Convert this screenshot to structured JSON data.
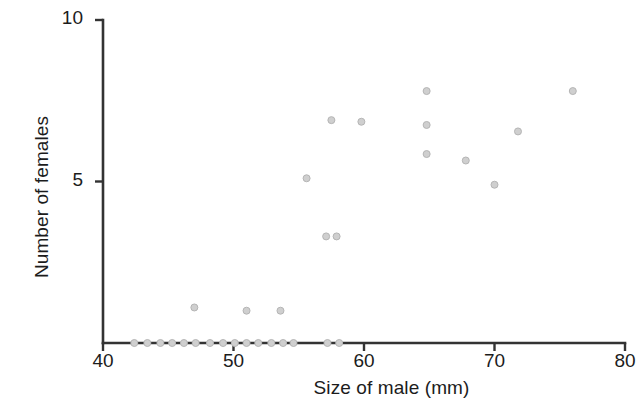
{
  "chart_data": {
    "type": "scatter",
    "title": "",
    "subtitle": "",
    "xlabel": "Size of male (mm)",
    "ylabel": "Number of females",
    "xlim": [
      40,
      80
    ],
    "ylim": [
      0,
      10
    ],
    "xticks": [
      40,
      50,
      60,
      70,
      80
    ],
    "xtick_labels": [
      "40",
      "50",
      "60",
      "70",
      "80"
    ],
    "yticks": [
      5,
      10
    ],
    "ytick_labels": [
      "5",
      "10"
    ],
    "grid": false,
    "legend": null,
    "marker": {
      "shape": "circle",
      "fill_color": "#cfcfcf",
      "edge_color": "#b5b5b5",
      "size_px": 7
    },
    "axis_color": "#333333",
    "series": [
      {
        "name": "males",
        "x": [
          42.4,
          43.4,
          44.4,
          45.3,
          46.2,
          47.1,
          48.2,
          49.2,
          50.1,
          51.0,
          51.9,
          52.9,
          53.8,
          54.6,
          57.2,
          58.1,
          47.0,
          51.0,
          53.6,
          55.6,
          57.1,
          57.9,
          57.5,
          59.8,
          64.8,
          64.8,
          64.8,
          67.8,
          70.0,
          71.8,
          76.0
        ],
        "y": [
          0,
          0,
          0,
          0,
          0,
          0,
          0,
          0,
          0,
          0,
          0,
          0,
          0,
          0,
          0,
          0,
          1.1,
          1.0,
          1.0,
          5.1,
          3.3,
          3.3,
          6.9,
          6.85,
          7.8,
          6.75,
          5.85,
          5.65,
          4.9,
          6.55,
          7.8
        ]
      }
    ],
    "n_points": 31
  },
  "figure": {
    "background": "#ffffff",
    "plot_area": {
      "left_px": 103,
      "right_px": 625,
      "top_px": 20,
      "bottom_px": 343
    }
  }
}
